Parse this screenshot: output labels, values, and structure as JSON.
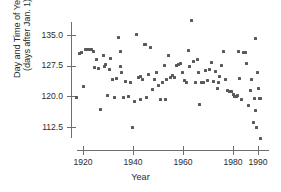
{
  "chart_data": {
    "type": "scatter",
    "title": "",
    "xlabel": "Year",
    "ylabel_line1": "Day and Time of Year",
    "ylabel_line2": "(days after Jan. 1)",
    "xlim": [
      1916,
      1992
    ],
    "ylim": [
      108.0,
      139.5
    ],
    "grid": false,
    "legend": null,
    "xticks": [
      1920,
      1940,
      1960,
      1980,
      1990
    ],
    "xtick_labels": [
      "1920",
      "1940",
      "1960",
      "1980",
      "1990"
    ],
    "yticks": [
      135.0,
      127.5,
      120.0,
      112.5
    ],
    "ytick_labels": [
      "135.0",
      "127.5",
      "120.0",
      "112.5"
    ],
    "marker": "square",
    "marker_color": "#595959",
    "axis_color": "#6e6e6e",
    "point_count": 110,
    "points": [
      [
        1917.5,
        119.8
      ],
      [
        1918.5,
        130.5
      ],
      [
        1919.5,
        130.6
      ],
      [
        1920.0,
        122.4
      ],
      [
        1920.8,
        131.4
      ],
      [
        1921.6,
        131.5
      ],
      [
        1922.4,
        131.5
      ],
      [
        1923.4,
        131.4
      ],
      [
        1924.2,
        130.9
      ],
      [
        1924.6,
        127.1
      ],
      [
        1925.4,
        129.0
      ],
      [
        1926.2,
        126.9
      ],
      [
        1927.0,
        116.9
      ],
      [
        1928.0,
        130.0
      ],
      [
        1929.0,
        127.7
      ],
      [
        1929.8,
        120.3
      ],
      [
        1930.6,
        126.6
      ],
      [
        1931.0,
        129.2
      ],
      [
        1931.8,
        124.2
      ],
      [
        1932.6,
        119.6
      ],
      [
        1933.4,
        124.3
      ],
      [
        1934.2,
        134.4
      ],
      [
        1935.0,
        131.0
      ],
      [
        1935.4,
        125.8
      ],
      [
        1936.2,
        119.6
      ],
      [
        1937.0,
        123.6
      ],
      [
        1938.0,
        119.9
      ],
      [
        1939.0,
        123.4
      ],
      [
        1939.6,
        112.3
      ],
      [
        1940.4,
        118.8
      ],
      [
        1941.2,
        135.1
      ],
      [
        1942.0,
        124.7
      ],
      [
        1942.8,
        124.8
      ],
      [
        1943.6,
        124.0
      ],
      [
        1944.4,
        132.6
      ],
      [
        1944.8,
        132.7
      ],
      [
        1945.4,
        119.7
      ],
      [
        1946.2,
        125.3
      ],
      [
        1947.0,
        131.9
      ],
      [
        1947.8,
        121.6
      ],
      [
        1948.6,
        124.2
      ],
      [
        1949.4,
        125.8
      ],
      [
        1950.2,
        122.6
      ],
      [
        1951.0,
        119.2
      ],
      [
        1951.8,
        123.4
      ],
      [
        1952.6,
        127.6
      ],
      [
        1953.4,
        124.1
      ],
      [
        1954.2,
        129.9
      ],
      [
        1955.0,
        124.6
      ],
      [
        1955.8,
        125.0
      ],
      [
        1956.6,
        124.5
      ],
      [
        1957.4,
        127.5
      ],
      [
        1958.2,
        127.8
      ],
      [
        1959.0,
        128.0
      ],
      [
        1959.6,
        125.8
      ],
      [
        1960.4,
        123.8
      ],
      [
        1961.2,
        123.3
      ],
      [
        1962.0,
        131.1
      ],
      [
        1962.6,
        127.2
      ],
      [
        1963.4,
        138.5
      ],
      [
        1964.2,
        128.4
      ],
      [
        1965.0,
        123.4
      ],
      [
        1965.8,
        129.0
      ],
      [
        1966.6,
        117.9
      ],
      [
        1967.4,
        123.5
      ],
      [
        1968.2,
        123.4
      ],
      [
        1969.0,
        126.3
      ],
      [
        1969.8,
        123.8
      ],
      [
        1970.6,
        126.5
      ],
      [
        1971.4,
        128.2
      ],
      [
        1972.2,
        123.7
      ],
      [
        1973.0,
        126.0
      ],
      [
        1973.8,
        121.9
      ],
      [
        1974.6,
        124.9
      ],
      [
        1975.4,
        127.6
      ],
      [
        1976.2,
        130.9
      ],
      [
        1977.0,
        124.0
      ],
      [
        1977.8,
        121.4
      ],
      [
        1978.6,
        121.3
      ],
      [
        1979.4,
        121.3
      ],
      [
        1980.2,
        120.5
      ],
      [
        1980.6,
        120.0
      ],
      [
        1981.0,
        119.9
      ],
      [
        1981.4,
        120.0
      ],
      [
        1981.8,
        120.1
      ],
      [
        1982.2,
        131.0
      ],
      [
        1982.6,
        124.3
      ],
      [
        1983.4,
        119.3
      ],
      [
        1984.2,
        130.6
      ],
      [
        1984.8,
        130.8
      ],
      [
        1985.4,
        128.0
      ],
      [
        1986.2,
        117.8
      ],
      [
        1986.8,
        121.5
      ],
      [
        1987.4,
        124.0
      ],
      [
        1988.0,
        113.6
      ],
      [
        1988.4,
        119.5
      ],
      [
        1988.8,
        116.5
      ],
      [
        1989.0,
        134.2
      ],
      [
        1989.4,
        112.4
      ],
      [
        1989.8,
        125.9
      ],
      [
        1990.2,
        122.0
      ],
      [
        1990.5,
        119.4
      ],
      [
        1990.8,
        119.5
      ],
      [
        1991.0,
        109.8
      ],
      [
        1928.6,
        127.2
      ],
      [
        1934.8,
        127.4
      ],
      [
        1943.0,
        119.3
      ],
      [
        1953.0,
        119.3
      ],
      [
        1974.0,
        123.5
      ],
      [
        1966.0,
        125.9
      ]
    ]
  }
}
